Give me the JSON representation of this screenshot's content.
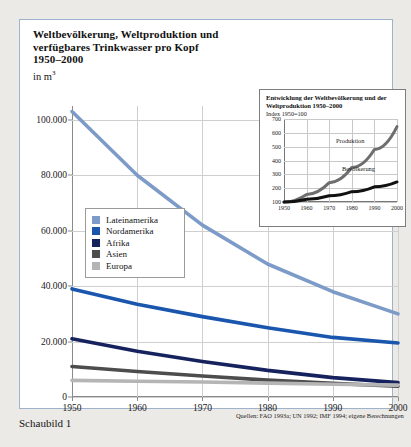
{
  "figure": {
    "title_lines": [
      "Weltbevölkerung, Weltproduktion und",
      "verfügbares Trinkwasser pro Kopf",
      "1950–2000"
    ],
    "unit_prefix": "in m",
    "unit_exponent": "3",
    "caption": "Schaubild 1",
    "source": "Quellen: FAO 1993a; UN 1992; IMF 1994; eigene Berechnungen",
    "frame_color": "#9fb2cc"
  },
  "chart_data": {
    "type": "line",
    "title": "Weltbevölkerung, Weltproduktion und verfügbares Trinkwasser pro Kopf 1950–2000",
    "xlabel": "",
    "ylabel": "in m³",
    "x": [
      1950,
      1960,
      1970,
      1980,
      1990,
      2000
    ],
    "xticklabels": [
      "1950",
      "1960",
      "1970",
      "1980",
      "1990",
      "2000"
    ],
    "xlim": [
      1950,
      2000
    ],
    "ylim": [
      0,
      105000
    ],
    "yticks": [
      0,
      20000,
      40000,
      60000,
      80000,
      100000
    ],
    "yticklabels": [
      "0",
      "20.000",
      "40.000",
      "60.000",
      "80.000",
      "100.000"
    ],
    "grid": true,
    "legend_position": "inner-left",
    "series": [
      {
        "name": "Lateinamerika",
        "color": "#7d9bc8",
        "values": [
          103000,
          80000,
          62000,
          48000,
          38000,
          30000
        ]
      },
      {
        "name": "Nordamerika",
        "color": "#1a56ad",
        "values": [
          39000,
          33500,
          29000,
          25000,
          21500,
          19500
        ]
      },
      {
        "name": "Afrika",
        "color": "#16225e",
        "values": [
          21000,
          16500,
          12800,
          9600,
          7000,
          5200
        ]
      },
      {
        "name": "Asien",
        "color": "#4d4d4d",
        "values": [
          11000,
          9200,
          7600,
          6100,
          4900,
          3900
        ]
      },
      {
        "name": "Europa",
        "color": "#b5b5b5",
        "values": [
          6000,
          5700,
          5400,
          5000,
          4600,
          4300
        ]
      }
    ]
  },
  "inset": {
    "title_lines": [
      "Entwicklung der Weltbevölkerung und der",
      "Weltproduktion 1950–2000"
    ],
    "subtitle": "Index 1950=100",
    "chart_data": {
      "type": "line",
      "x": [
        1950,
        1960,
        1970,
        1980,
        1990,
        2000
      ],
      "xticklabels": [
        "1950",
        "1960",
        "1970",
        "1980",
        "1990",
        "2000"
      ],
      "xlim": [
        1950,
        2000
      ],
      "ylim": [
        100,
        700
      ],
      "yticks": [
        100,
        200,
        300,
        400,
        500,
        600,
        700
      ],
      "yticklabels": [
        "100",
        "200",
        "300",
        "400",
        "500",
        "600",
        "700"
      ],
      "grid": true,
      "series": [
        {
          "name": "Produktion",
          "color": "#6e6e6e",
          "values": [
            100,
            155,
            240,
            350,
            480,
            645
          ]
        },
        {
          "name": "Bevölkerung",
          "color": "#111111",
          "values": [
            100,
            120,
            145,
            175,
            210,
            245
          ]
        }
      ]
    }
  },
  "legend": {
    "items": [
      {
        "label": "Lateinamerika",
        "color": "#7d9bc8"
      },
      {
        "label": "Nordamerika",
        "color": "#1a56ad"
      },
      {
        "label": "Afrika",
        "color": "#16225e"
      },
      {
        "label": "Asien",
        "color": "#4d4d4d"
      },
      {
        "label": "Europa",
        "color": "#b5b5b5"
      }
    ]
  }
}
